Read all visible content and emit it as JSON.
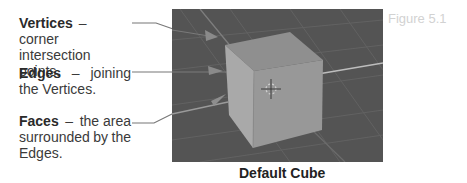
{
  "figure": {
    "number": "Figure 5.1",
    "caption": "Default Cube"
  },
  "labels": [
    {
      "term": "Vertices",
      "dash": "–",
      "desc_1": "corner",
      "desc_2": "intersection points."
    },
    {
      "term": "Edges",
      "dash": "–",
      "desc_1": "joining",
      "desc_2": "the Vertices."
    },
    {
      "term": "Faces",
      "dash": "–",
      "desc_1": "the area",
      "desc_2": "surrounded by the",
      "desc_3": "Edges."
    }
  ],
  "colors": {
    "viewport_bg": "#555555",
    "grid_line": "#6a6a6a",
    "cube_top": "#8f8f8f",
    "cube_left": "#a9a9a9",
    "cube_front": "#9a9a9a",
    "leader_line": "#777777"
  },
  "icons": {
    "center": "3d-cursor-icon",
    "pointers": "arrow-icon"
  }
}
